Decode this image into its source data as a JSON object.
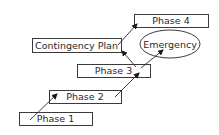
{
  "diagram": {
    "nodes": [
      {
        "id": "phase1",
        "label": "Phase 1",
        "shape": "rect",
        "x": 19,
        "y": 112,
        "w": 73,
        "h": 13
      },
      {
        "id": "phase2",
        "label": "Phase 2",
        "shape": "rect",
        "x": 49,
        "y": 90,
        "w": 72,
        "h": 13
      },
      {
        "id": "phase3",
        "label": "Phase 3",
        "shape": "rect",
        "x": 77,
        "y": 64,
        "w": 73,
        "h": 13
      },
      {
        "id": "contingency",
        "label": "Contingency Plan",
        "shape": "rect",
        "x": 32,
        "y": 38,
        "w": 89,
        "h": 14
      },
      {
        "id": "phase4",
        "label": "Phase 4",
        "shape": "rect",
        "x": 134,
        "y": 14,
        "w": 74,
        "h": 13
      },
      {
        "id": "emergency",
        "label": "Emergency",
        "shape": "ellipse",
        "cx": 170,
        "cy": 44,
        "rx": 30,
        "ry": 14
      }
    ],
    "edges": [
      {
        "from": "phase1",
        "to": "phase2",
        "x1": 30,
        "y1": 120,
        "x2": 57,
        "y2": 94
      },
      {
        "from": "phase2",
        "to": "phase3",
        "x1": 115,
        "y1": 97,
        "x2": 139,
        "y2": 73
      },
      {
        "from": "phase3",
        "to": "contingency",
        "x1": 136,
        "y1": 67,
        "x2": 122,
        "y2": 51
      },
      {
        "from": "phase3",
        "to": "emergency",
        "x1": 141,
        "y1": 68,
        "x2": 163,
        "y2": 50
      },
      {
        "from": "contingency",
        "to": "phase4",
        "x1": 118,
        "y1": 45,
        "x2": 137,
        "y2": 24
      }
    ]
  }
}
